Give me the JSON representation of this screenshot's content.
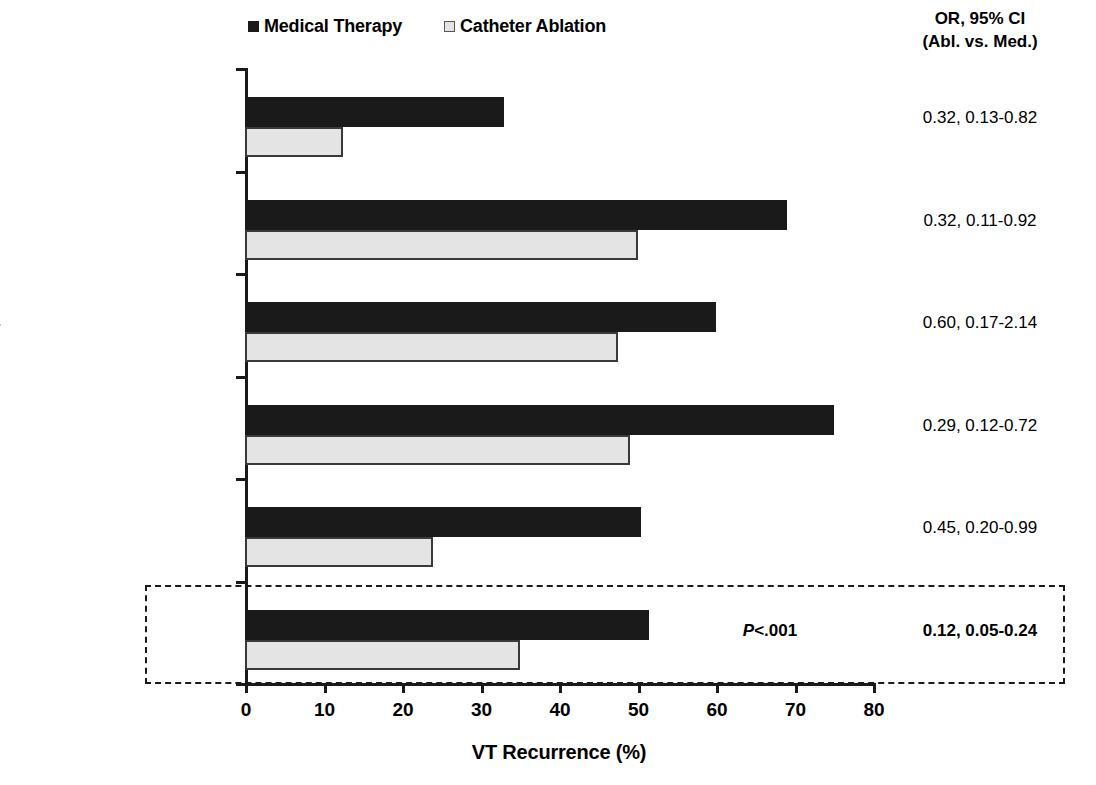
{
  "legend": {
    "items": [
      {
        "label": "Medical Therapy",
        "swatch": "dark-square-icon",
        "color": "#1a1a1a"
      },
      {
        "label": "Catheter Ablation",
        "swatch": "light-square-icon",
        "color": "#e3e3e3"
      }
    ]
  },
  "or_header": {
    "line1": "OR, 95% CI",
    "line2": "(Abl. vs. Med.)"
  },
  "overall": {
    "pvalue": "<.001",
    "pvalue_prefix": "P"
  },
  "chart_data": {
    "type": "bar",
    "orientation": "horizontal",
    "title": "",
    "xlabel": "VT Recurrence (%)",
    "ylabel": "",
    "xlim": [
      0,
      80
    ],
    "xticks": [
      0,
      10,
      20,
      30,
      40,
      50,
      60,
      70,
      80
    ],
    "grid": false,
    "legend_position": "top",
    "categories": [
      "Epstein et al. 1998",
      "Niwano et al. 2008",
      "Schreieck et al. 2004",
      "SMASH-VT, 2007",
      "VTACH, 2010",
      "Overall"
    ],
    "series": [
      {
        "name": "Medical Therapy",
        "color": "#1a1a1a",
        "values": [
          33,
          69,
          60,
          75,
          50.5,
          51.5
        ]
      },
      {
        "name": "Catheter Ablation",
        "color": "#e4e4e4",
        "values": [
          12.5,
          50,
          47.5,
          49,
          24,
          35
        ]
      }
    ],
    "annotations": {
      "column_header": "OR, 95% CI (Abl. vs. Med.)",
      "or_values": [
        "0.32, 0.13-0.82",
        "0.32, 0.11-0.92",
        "0.60, 0.17-2.14",
        "0.29, 0.12-0.72",
        "0.45, 0.20-0.99",
        "0.12, 0.05-0.24"
      ],
      "pvalue": "P<.001"
    }
  }
}
